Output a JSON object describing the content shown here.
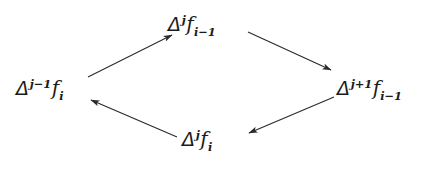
{
  "diagram": {
    "type": "commutative-diamond",
    "background_color": "#ffffff",
    "stroke_color": "#2b2b2b",
    "text_color": "#1b1b1b",
    "nodes": [
      {
        "id": "top",
        "position": "top",
        "plain_text": "Δ^j f_{i-1}",
        "delta": "Δ",
        "superscript": "j",
        "function": "f",
        "subscript": "i−1"
      },
      {
        "id": "left",
        "position": "left",
        "plain_text": "Δ^{j-1} f_i",
        "delta": "Δ",
        "superscript": "j−1",
        "function": "f",
        "subscript": "i"
      },
      {
        "id": "right",
        "position": "right",
        "plain_text": "Δ^{j+1} f_{i-1}",
        "delta": "Δ",
        "superscript": "j+1",
        "function": "f",
        "subscript": "i−1"
      },
      {
        "id": "bottom",
        "position": "bottom",
        "plain_text": "Δ^j f_i",
        "delta": "Δ",
        "superscript": "j",
        "function": "f",
        "subscript": "i"
      }
    ],
    "arrows": [
      {
        "id": "left-to-top",
        "from": "left",
        "to": "top",
        "x1": 88,
        "y1": 77,
        "x2": 172,
        "y2": 35
      },
      {
        "id": "top-to-right",
        "from": "top",
        "to": "right",
        "x1": 248,
        "y1": 32,
        "x2": 331,
        "y2": 70
      },
      {
        "id": "right-to-bottom",
        "from": "right",
        "to": "bottom",
        "x1": 334,
        "y1": 97,
        "x2": 249,
        "y2": 133
      },
      {
        "id": "bottom-to-left",
        "from": "bottom",
        "to": "left",
        "x1": 177,
        "y1": 137,
        "x2": 91,
        "y2": 100
      }
    ]
  }
}
